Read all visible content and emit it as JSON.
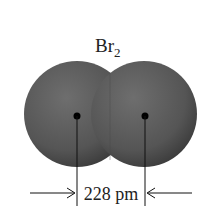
{
  "diagram": {
    "title": "Br",
    "title_subscript": "2",
    "distance_label": "228 pm",
    "atoms": [
      {
        "name": "left-bromine-atom",
        "cx": 77,
        "cy": 114,
        "r": 53
      },
      {
        "name": "right-bromine-atom",
        "cx": 144,
        "cy": 114,
        "r": 53
      }
    ],
    "colors": {
      "atom": "#5a5a5a",
      "atom_dark": "#3c3c3c",
      "line": "#111111"
    }
  }
}
